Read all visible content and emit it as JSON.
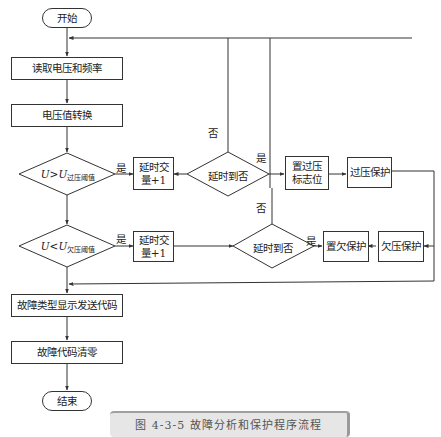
{
  "diagram": {
    "type": "flowchart",
    "nodes": {
      "start": "开始",
      "read": "读取电压和频率",
      "convert": "电压值转换",
      "over_cond": {
        "main": "U>U",
        "sub": "过压阈值"
      },
      "over_delay_inc": "延时交量+1",
      "over_delay_check": "延时到否",
      "set_over_flag": "置过压标志位",
      "over_protect": "过压保护",
      "under_cond": {
        "main": "U<U",
        "sub": "欠压阈值"
      },
      "under_delay_inc": "延时交量+1",
      "under_delay_check": "延时到否",
      "set_under": "置欠保护",
      "under_protect": "欠压保护",
      "fault_display": "故障类型显示发送代码",
      "fault_clear": "故障代码清零",
      "end": "结束"
    },
    "edge_labels": {
      "over_yes": "是",
      "over_delay_yes": "是",
      "over_delay_no": "否",
      "under_yes": "是",
      "under_delay_yes": "是",
      "under_delay_no": "否"
    },
    "caption": "图 4-3-5  故障分析和保护程序流程"
  }
}
